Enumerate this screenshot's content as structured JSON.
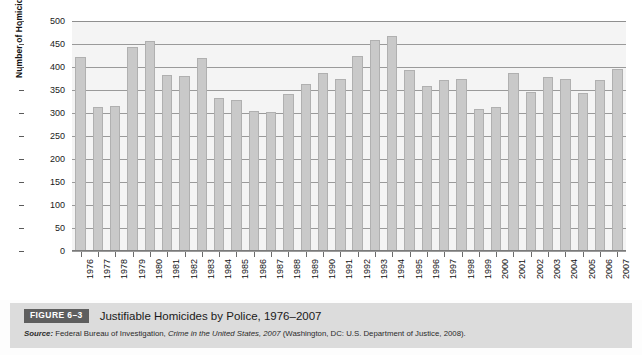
{
  "figure": {
    "tag": "FIGURE 6–3",
    "title": "Justifiable Homicides by Police, 1976–2007",
    "source_label": "Source:",
    "source_text_1": " Federal Bureau of Investigation, ",
    "source_italic": "Crime in the United States, 2007",
    "source_text_2": " (Washington, DC: U.S. Department of Justice, 2008)."
  },
  "chart_data": {
    "type": "bar",
    "title": "Justifiable Homicides by Police, 1976–2007",
    "xlabel": "",
    "ylabel": "Number of Homicides",
    "ylim": [
      0,
      500
    ],
    "ytick_step": 50,
    "yticks": [
      "0",
      "50",
      "100",
      "150",
      "200",
      "250",
      "300",
      "350",
      "400",
      "450",
      "500"
    ],
    "grid": true,
    "legend": "none",
    "bar_color": "#c9c9c9",
    "bar_border_color": "#b0b0b0",
    "plot_background": "#f4f4f4",
    "categories": [
      "1976",
      "1977",
      "1978",
      "1979",
      "1980",
      "1981",
      "1982",
      "1983",
      "1984",
      "1985",
      "1986",
      "1987",
      "1988",
      "1989",
      "1990",
      "1991",
      "1992",
      "1993",
      "1994",
      "1995",
      "1996",
      "1997",
      "1998",
      "1999",
      "2000",
      "2001",
      "2002",
      "2003",
      "2004",
      "2005",
      "2006",
      "2007"
    ],
    "values": [
      422,
      314,
      315,
      444,
      457,
      383,
      380,
      420,
      333,
      328,
      304,
      302,
      341,
      362,
      388,
      373,
      424,
      459,
      468,
      393,
      358,
      371,
      374,
      308,
      312,
      386,
      345,
      378,
      375,
      344,
      371,
      396
    ]
  }
}
